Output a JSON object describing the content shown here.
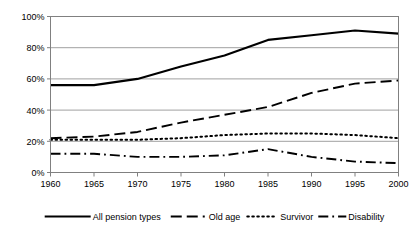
{
  "chart_data": {
    "type": "line",
    "title": "",
    "subtitle": "",
    "xlabel": "",
    "ylabel": "",
    "x": [
      1960,
      1965,
      1970,
      1975,
      1980,
      1985,
      1990,
      1995,
      2000
    ],
    "categories": [
      "1960",
      "1965",
      "1970",
      "1975",
      "1980",
      "1985",
      "1990",
      "1995",
      "2000"
    ],
    "xtick_labels": [
      "1960",
      "1965",
      "1970",
      "1975",
      "1980",
      "1985",
      "1990",
      "1995",
      "2000"
    ],
    "ytick_labels": [
      "0%",
      "20%",
      "40%",
      "60%",
      "80%",
      "100%"
    ],
    "ytick_values": [
      0,
      20,
      40,
      60,
      80,
      100
    ],
    "xlim": [
      1960,
      2000
    ],
    "ylim": [
      0,
      100
    ],
    "grid": "horizontal",
    "legend_position": "bottom",
    "series": [
      {
        "name": "All pension types",
        "style": "solid",
        "color": "#000000",
        "values": [
          56,
          56,
          60,
          68,
          75,
          85,
          88,
          91,
          89
        ]
      },
      {
        "name": "Old age",
        "style": "dashed",
        "color": "#000000",
        "values": [
          22,
          23,
          26,
          32,
          37,
          42,
          51,
          57,
          59
        ]
      },
      {
        "name": "Survivor",
        "style": "dotted",
        "color": "#000000",
        "values": [
          21,
          21,
          21,
          22,
          24,
          25,
          25,
          24,
          22
        ]
      },
      {
        "name": "Disability",
        "style": "dashdot",
        "color": "#000000",
        "values": [
          12,
          12,
          10,
          10,
          11,
          15,
          10,
          7,
          6
        ]
      }
    ]
  },
  "legend": {
    "items": [
      {
        "label": "All pension types",
        "style": "solid"
      },
      {
        "label": "Old age",
        "style": "dashed"
      },
      {
        "label": "Survivor",
        "style": "dotted"
      },
      {
        "label": "Disability",
        "style": "dashdot"
      }
    ]
  },
  "colors": {
    "line": "#000000",
    "grid": "#a0a0a0",
    "axis": "#808080",
    "background": "#ffffff"
  }
}
